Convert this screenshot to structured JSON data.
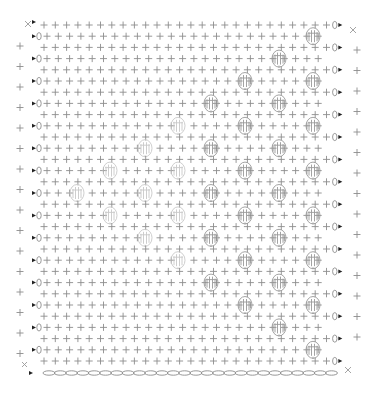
{
  "chart_data": {
    "type": "crochet-stitch-diagram",
    "rows": 31,
    "stitches_per_row": 26,
    "foundation": "chain",
    "symbols": {
      "single_crochet": "+",
      "chain": "0",
      "bobble": "bobble",
      "slip_stitch_start": "x",
      "fasten": "▸"
    },
    "legend": [],
    "bobble_rows": [
      {
        "row": 2,
        "x": [
          313
        ]
      },
      {
        "row": 4,
        "x": [
          279
        ]
      },
      {
        "row": 6,
        "x": [
          245,
          313
        ]
      },
      {
        "row": 8,
        "x": [
          211,
          279
        ]
      },
      {
        "row": 10,
        "x": [
          178,
          245,
          313
        ]
      },
      {
        "row": 12,
        "x": [
          145,
          211,
          279
        ]
      },
      {
        "row": 14,
        "x": [
          110,
          178,
          245,
          313
        ]
      },
      {
        "row": 16,
        "x": [
          77,
          145,
          211,
          279
        ]
      },
      {
        "row": 18,
        "x": [
          110,
          178,
          245,
          313
        ]
      },
      {
        "row": 20,
        "x": [
          145,
          211,
          279
        ]
      },
      {
        "row": 22,
        "x": [
          178,
          245,
          313
        ]
      },
      {
        "row": 24,
        "x": [
          211,
          279
        ]
      },
      {
        "row": 26,
        "x": [
          245,
          313
        ]
      },
      {
        "row": 28,
        "x": [
          279
        ]
      },
      {
        "row": 30,
        "x": [
          313
        ]
      }
    ],
    "light_bobbles_x_max": 185,
    "edge_sc_left": 16,
    "edge_sc_right": 15
  },
  "colors": {
    "stitch": "#8c8c8c",
    "bobble": "#9a9a9a",
    "bobble_light": "#c8c8c8",
    "marker": "#222222"
  }
}
